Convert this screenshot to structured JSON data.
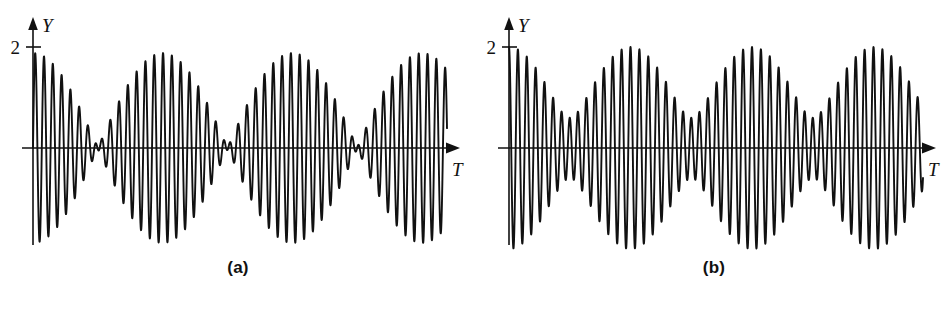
{
  "figure": {
    "background": "#ffffff",
    "ink": "#111111",
    "width": 952,
    "height": 310
  },
  "panels": [
    {
      "id": "a",
      "caption": "(a)",
      "y_axis_label": "Y",
      "x_axis_label": "T",
      "y_tick_label": "2",
      "y_arrow_icon": "arrow-up-icon",
      "x_arrow_icon": "arrow-right-icon",
      "y_tick_icon": "tick-mark-icon"
    },
    {
      "id": "b",
      "caption": "(b)",
      "y_axis_label": "Y",
      "x_axis_label": "T",
      "y_tick_label": "2",
      "y_arrow_icon": "arrow-up-icon",
      "x_arrow_icon": "arrow-right-icon",
      "y_tick_icon": "tick-mark-icon"
    }
  ],
  "chart_data": [
    {
      "type": "line",
      "panel": "a",
      "title": "(a)",
      "xlabel": "T",
      "ylabel": "Y",
      "ytick_values": [
        2
      ],
      "ytick_labels": [
        "2"
      ],
      "ylim": [
        -2.15,
        2.15
      ],
      "xlim": [
        0,
        46.0
      ],
      "grid": false,
      "legend": null,
      "description": "Beats: superposition of two nearly equal-amplitude waves of slightly different frequency; envelope falls to near-zero nulls between beats.",
      "model": "y = A1*sin(2*pi*f1*t) + A2*sin(2*pi*f2*t)",
      "components": [
        {
          "name": "wave-1",
          "amplitude": 0.96,
          "frequency": 1.0555,
          "phase": 0.0
        },
        {
          "name": "wave-2",
          "amplitude": 0.92,
          "frequency": 0.9861,
          "phase": 0.0
        }
      ],
      "envelope": {
        "maximum": 1.88,
        "minimum": 0.05,
        "beat_period_units": 14.4,
        "nulls_at": [
          14.4,
          28.8,
          43.2
        ],
        "maxima_at": [
          7.2,
          21.6,
          36.0
        ]
      },
      "carrier_period_units": 0.9,
      "carrier_cycles_per_beat": 16,
      "starts_at_zero": true
    },
    {
      "type": "line",
      "panel": "b",
      "title": "(b)",
      "xlabel": "T",
      "ylabel": "Y",
      "ytick_values": [
        2
      ],
      "ytick_labels": [
        "2"
      ],
      "ylim": [
        -2.15,
        2.15
      ],
      "xlim": [
        0,
        46.0
      ],
      "grid": false,
      "legend": null,
      "description": "Partial amplitude modulation: two waves of unequal amplitude and slightly different frequency; envelope minimum stays well above zero. Trace begins at maximum value 2 on the Y axis.",
      "model": "y = A1*cos(2*pi*f1*t) + A2*cos(2*pi*f2*t)",
      "components": [
        {
          "name": "wave-1",
          "amplitude": 1.3,
          "frequency": 1.037,
          "phase": 0.0
        },
        {
          "name": "wave-2",
          "amplitude": 0.7,
          "frequency": 0.963,
          "phase": 0.0
        }
      ],
      "envelope": {
        "maximum": 2.0,
        "minimum": 0.6,
        "modulation_period_units": 13.5,
        "maxima_at": [
          0.0,
          13.5,
          27.0,
          40.5
        ],
        "minima_at": [
          6.75,
          20.25,
          33.75
        ]
      },
      "carrier_period_units": 0.9,
      "carrier_cycles_per_modulation": 15,
      "starts_at_maximum": true
    }
  ]
}
